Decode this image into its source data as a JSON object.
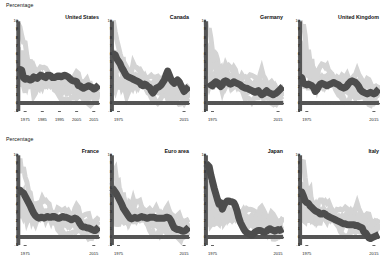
{
  "figure": {
    "rows": [
      {
        "axis_label": "Percentage",
        "panels": [
          "united_states",
          "canada",
          "germany",
          "united_kingdom"
        ]
      },
      {
        "axis_label": "Percentage",
        "panels": [
          "france",
          "euro_area",
          "japan",
          "italy"
        ]
      }
    ],
    "colors": {
      "focus_line": "#4d4d4d",
      "background_lines": "#d4d4d4",
      "axis": "#555555",
      "zero_line": "#555555",
      "text": "#111111"
    }
  },
  "chart_data": {
    "type": "line",
    "title": "",
    "xlabel": "",
    "ylabel": "Percentage",
    "ylim": [
      -1,
      10
    ],
    "xlim": [
      1971,
      2018
    ],
    "yticks": [
      -1,
      0,
      1,
      2,
      3,
      4,
      5,
      6,
      7,
      8,
      9,
      10
    ],
    "grid": false,
    "legend": "none",
    "x": [
      1971,
      1972,
      1973,
      1974,
      1975,
      1976,
      1977,
      1978,
      1979,
      1980,
      1981,
      1982,
      1983,
      1984,
      1985,
      1986,
      1987,
      1988,
      1989,
      1990,
      1991,
      1992,
      1993,
      1994,
      1995,
      1996,
      1997,
      1998,
      1999,
      2000,
      2001,
      2002,
      2003,
      2004,
      2005,
      2006,
      2007,
      2008,
      2009,
      2010,
      2011,
      2012,
      2013,
      2014,
      2015,
      2016,
      2017,
      2018
    ],
    "panels": [
      {
        "key": "united_states",
        "title": "United States",
        "xticks": [
          1975,
          1985,
          1995,
          2005,
          2015
        ],
        "xticklabels": [
          "1975",
          "1985",
          "1995",
          "2005",
          "2015"
        ],
        "series": [
          {
            "name": "United States",
            "highlight": true,
            "values": [
              4.0,
              4.1,
              4.0,
              3.1,
              2.9,
              3.0,
              2.9,
              2.8,
              2.9,
              3.2,
              3.1,
              3.0,
              3.2,
              3.4,
              3.3,
              3.2,
              3.1,
              3.4,
              3.4,
              3.3,
              3.1,
              3.1,
              3.2,
              3.3,
              3.3,
              3.2,
              3.3,
              3.4,
              3.3,
              3.2,
              3.0,
              2.8,
              2.7,
              2.7,
              2.6,
              2.1,
              2.1,
              1.9,
              1.8,
              1.9,
              2.0,
              2.1,
              2.0,
              1.9,
              1.7,
              1.8,
              2.0,
              2.2
            ]
          }
        ]
      },
      {
        "key": "canada",
        "title": "Canada",
        "xticks": [
          1975,
          2015
        ],
        "xticklabels": [
          "1975",
          "2015"
        ],
        "series": [
          {
            "name": "Canada",
            "highlight": true,
            "values": [
              6.0,
              6.0,
              5.9,
              5.4,
              5.1,
              4.8,
              4.3,
              4.0,
              3.6,
              3.3,
              3.2,
              3.1,
              3.0,
              2.9,
              2.8,
              2.7,
              2.6,
              2.5,
              2.2,
              2.1,
              2.3,
              2.2,
              2.0,
              1.9,
              1.5,
              1.2,
              1.5,
              1.8,
              1.9,
              2.0,
              2.2,
              2.5,
              2.8,
              3.4,
              3.9,
              3.4,
              2.9,
              2.6,
              2.4,
              2.6,
              2.8,
              2.6,
              2.2,
              1.8,
              1.4,
              1.6,
              1.8,
              2.0
            ]
          }
        ]
      },
      {
        "key": "germany",
        "title": "Germany",
        "xticks": [
          1975,
          2015
        ],
        "xticklabels": [
          "1975",
          "2015"
        ],
        "series": [
          {
            "name": "Germany",
            "highlight": true,
            "values": [
              null,
              null,
              2.5,
              2.2,
              2.1,
              2.4,
              2.6,
              2.5,
              2.2,
              2.0,
              2.2,
              2.6,
              2.7,
              2.6,
              2.4,
              2.3,
              2.4,
              2.6,
              2.5,
              2.4,
              2.3,
              2.2,
              2.0,
              1.9,
              1.8,
              1.8,
              1.7,
              1.6,
              1.5,
              1.4,
              1.3,
              1.4,
              1.5,
              1.2,
              1.0,
              1.1,
              1.3,
              1.5,
              1.3,
              1.2,
              1.1,
              1.0,
              1.1,
              1.2,
              1.4,
              1.6,
              1.8,
              2.0
            ]
          }
        ]
      },
      {
        "key": "united_kingdom",
        "title": "United Kingdom",
        "xticks": [
          1975,
          2015
        ],
        "xticklabels": [
          "1975",
          "2015"
        ],
        "series": [
          {
            "name": "United Kingdom",
            "highlight": true,
            "values": [
              3.2,
              3.1,
              2.4,
              2.3,
              2.2,
              2.3,
              2.2,
              2.1,
              1.9,
              1.4,
              1.6,
              2.0,
              2.3,
              2.4,
              2.3,
              2.2,
              2.1,
              2.2,
              2.3,
              2.4,
              2.5,
              2.4,
              2.3,
              2.2,
              2.0,
              1.9,
              1.8,
              1.9,
              2.1,
              2.4,
              2.6,
              2.7,
              2.6,
              2.5,
              2.3,
              2.0,
              1.6,
              1.4,
              1.3,
              1.2,
              1.1,
              1.2,
              1.3,
              1.2,
              1.1,
              1.2,
              1.5,
              1.7
            ]
          }
        ]
      },
      {
        "key": "france",
        "title": "France",
        "xticks": [
          1975,
          2015
        ],
        "xticklabels": [
          "1975",
          "2015"
        ],
        "series": [
          {
            "name": "France",
            "highlight": true,
            "values": [
              5.6,
              5.7,
              5.5,
              5.4,
              5.0,
              4.6,
              4.2,
              3.8,
              3.3,
              2.9,
              2.6,
              2.4,
              2.3,
              2.4,
              2.4,
              2.3,
              2.4,
              2.5,
              2.4,
              2.4,
              2.5,
              2.5,
              2.4,
              2.3,
              2.3,
              2.4,
              2.5,
              2.4,
              2.4,
              2.3,
              2.2,
              2.1,
              2.2,
              2.3,
              2.2,
              2.0,
              1.6,
              1.3,
              1.2,
              1.2,
              1.1,
              1.1,
              1.0,
              0.9,
              0.8,
              0.8,
              1.0,
              1.2
            ]
          }
        ]
      },
      {
        "key": "euro_area",
        "title": "Euro area",
        "xticks": [
          1975,
          2015
        ],
        "xticklabels": [
          "1975",
          "2015"
        ],
        "series": [
          {
            "name": "Euro area",
            "highlight": true,
            "values": [
              6.0,
              5.8,
              5.5,
              5.2,
              4.8,
              4.4,
              4.0,
              3.5,
              3.2,
              2.9,
              2.6,
              2.3,
              2.2,
              2.3,
              2.4,
              2.3,
              2.3,
              2.4,
              2.5,
              2.4,
              2.4,
              2.3,
              2.3,
              2.4,
              2.4,
              2.4,
              2.4,
              2.3,
              2.3,
              2.3,
              2.3,
              2.3,
              2.3,
              2.4,
              2.4,
              2.3,
              2.0,
              1.5,
              1.1,
              1.0,
              0.9,
              0.9,
              0.8,
              0.7,
              0.7,
              0.8,
              1.0,
              1.2
            ]
          }
        ]
      },
      {
        "key": "japan",
        "title": "Japan",
        "xticks": [
          1975,
          2015
        ],
        "xticklabels": [
          "1975",
          "2015"
        ],
        "series": [
          {
            "name": "Japan",
            "highlight": true,
            "values": [
              9.0,
              8.8,
              8.6,
              7.6,
              6.8,
              6.0,
              5.3,
              4.6,
              4.0,
              4.2,
              3.4,
              3.9,
              4.2,
              4.4,
              4.4,
              4.3,
              4.3,
              4.2,
              3.8,
              3.2,
              2.4,
              1.8,
              1.4,
              1.0,
              0.7,
              0.5,
              0.4,
              0.3,
              0.2,
              0.4,
              0.6,
              0.7,
              0.8,
              0.8,
              0.7,
              0.6,
              0.6,
              0.7,
              0.9,
              1.0,
              0.9,
              0.8,
              0.7,
              0.8,
              0.9,
              0.8,
              0.9,
              1.0
            ]
          }
        ]
      },
      {
        "key": "italy",
        "title": "Italy",
        "xticks": [
          1975,
          2015
        ],
        "xticklabels": [
          "1975",
          "2015"
        ],
        "series": [
          {
            "name": "Italy",
            "highlight": true,
            "values": [
              5.4,
              5.5,
              5.0,
              4.4,
              4.2,
              4.1,
              3.8,
              3.6,
              3.4,
              3.2,
              3.1,
              3.0,
              2.8,
              2.8,
              2.9,
              2.8,
              2.6,
              2.5,
              2.4,
              2.3,
              2.2,
              2.1,
              2.0,
              1.9,
              1.8,
              1.7,
              1.6,
              1.6,
              1.5,
              1.5,
              1.5,
              1.5,
              1.5,
              1.4,
              1.4,
              1.3,
              1.2,
              1.1,
              0.6,
              0.5,
              0.2,
              -0.1,
              -0.2,
              -0.1,
              0.0,
              0.1,
              0.2,
              0.3
            ]
          }
        ]
      }
    ],
    "background_series_note": "Each panel also displays the other economies' series in light grey for comparison."
  }
}
